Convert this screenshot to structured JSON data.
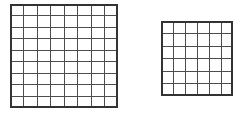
{
  "figure": {
    "background_color": "#ffffff",
    "canvas": {
      "width": 243,
      "height": 120
    }
  },
  "style": {
    "interior_line_color": "#4d4d4d",
    "border_line_color": "#333333",
    "interior_line_width": 1,
    "border_line_width": 1.6,
    "fill_color": "#ffffff"
  },
  "grids": [
    {
      "name": "left-grid",
      "label": "Large grid",
      "columns": 8,
      "rows": 9,
      "x": 10,
      "y": 4,
      "width": 108,
      "height": 104,
      "cell_width": 13.5,
      "cell_height": 11.56,
      "total_cells": 72
    },
    {
      "name": "right-grid",
      "label": "Small grid",
      "columns": 6,
      "rows": 6,
      "x": 161,
      "y": 21,
      "width": 72,
      "height": 75,
      "cell_width": 12,
      "cell_height": 12.5,
      "total_cells": 36
    }
  ]
}
